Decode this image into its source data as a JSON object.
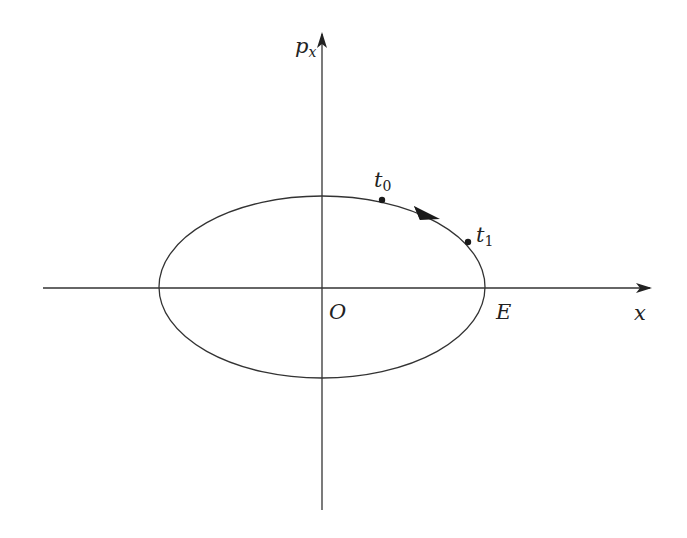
{
  "diagram": {
    "type": "phase-portrait",
    "colors": {
      "stroke": "#333333",
      "background": "#ffffff",
      "text": "#222222"
    },
    "axes": {
      "horizontal": {
        "label_base": "x",
        "label_sub": ""
      },
      "vertical": {
        "label_base": "p",
        "label_sub": "x"
      }
    },
    "origin_label": "O",
    "ellipse": {
      "cx": 322,
      "cy": 287,
      "rx": 163,
      "ry": 91
    },
    "points": [
      {
        "id": "t0",
        "label_base": "t",
        "label_sub": "0"
      },
      {
        "id": "t1",
        "label_base": "t",
        "label_sub": "1"
      }
    ],
    "intercept_label": "E",
    "direction": "clockwise"
  }
}
